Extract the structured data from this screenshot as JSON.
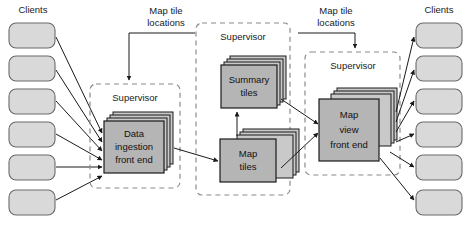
{
  "diagram": {
    "type": "architecture-block-diagram",
    "background_color": "#ffffff",
    "palette": {
      "node_fill": "#b5b5b5",
      "node_stroke": "#1a1a1a",
      "stack_fill": "#c9c9c9",
      "client_fill": "#d9d9d9",
      "client_stroke": "#6a6a6a",
      "group_border": "#8a8a8a",
      "arrow_color": "#1a1a1a",
      "text_color": "#1a1a1a"
    },
    "client_groups": [
      {
        "id": "clients-left",
        "title": "Clients",
        "count": 6,
        "side": "left",
        "boxes": [
          {
            "label": ""
          },
          {
            "label": ""
          },
          {
            "label": ""
          },
          {
            "label": ""
          },
          {
            "label": ""
          },
          {
            "label": ""
          }
        ]
      },
      {
        "id": "clients-right",
        "title": "Clients",
        "count": 6,
        "side": "right",
        "boxes": [
          {
            "label": ""
          },
          {
            "label": ""
          },
          {
            "label": ""
          },
          {
            "label": ""
          },
          {
            "label": ""
          },
          {
            "label": ""
          }
        ]
      }
    ],
    "groups": [
      {
        "id": "supervisor-left",
        "title": "Supervisor",
        "nodes": [
          "data-ingestion-front-end"
        ]
      },
      {
        "id": "supervisor-middle",
        "title": "Supervisor",
        "nodes": [
          "summary-tiles",
          "map-tiles"
        ]
      },
      {
        "id": "supervisor-right",
        "title": "Supervisor",
        "nodes": [
          "map-view-front-end"
        ]
      }
    ],
    "nodes": [
      {
        "id": "data-ingestion-front-end",
        "lines": [
          "Data",
          "ingestion",
          "front end"
        ],
        "replicated": true,
        "stack_depth": 4
      },
      {
        "id": "summary-tiles",
        "lines": [
          "Summary",
          "tiles"
        ],
        "replicated": true,
        "stack_depth": 4
      },
      {
        "id": "map-tiles",
        "lines": [
          "Map",
          "tiles"
        ],
        "replicated": true,
        "stack_depth": 4
      },
      {
        "id": "map-view-front-end",
        "lines": [
          "Map",
          "view",
          "front end"
        ],
        "replicated": true,
        "stack_depth": 4
      }
    ],
    "annotations": [
      {
        "id": "map-tile-locations-left",
        "lines": [
          "Map tile",
          "locations"
        ],
        "points_to": "supervisor-left"
      },
      {
        "id": "map-tile-locations-right",
        "lines": [
          "Map tile",
          "locations"
        ],
        "points_to": "supervisor-right"
      }
    ],
    "flows": [
      {
        "from": "clients-left",
        "to": "data-ingestion-front-end",
        "count": 6
      },
      {
        "from": "data-ingestion-front-end",
        "to": "map-tiles",
        "count": 1
      },
      {
        "from": "map-tiles",
        "to": "summary-tiles",
        "count": 1
      },
      {
        "from": "summary-tiles",
        "to": "map-view-front-end",
        "count": 1
      },
      {
        "from": "map-tiles",
        "to": "map-view-front-end",
        "count": 1
      },
      {
        "from": "map-view-front-end",
        "to": "clients-right",
        "count": 6
      }
    ]
  }
}
